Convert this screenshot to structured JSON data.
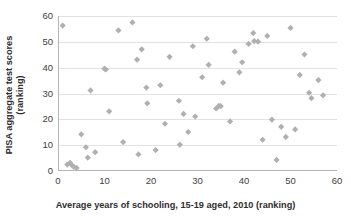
{
  "chart_data": {
    "type": "scatter",
    "title": "",
    "xlabel": "Average years of schooling, 15-19 aged, 2010 (ranking)",
    "ylabel_lines": [
      "PISA aggregate test scores",
      "(ranking)"
    ],
    "ylabel": "PISA aggregate test scores (ranking)",
    "xlim": [
      0,
      60
    ],
    "ylim": [
      0,
      60
    ],
    "xticks": [
      0,
      10,
      20,
      30,
      40,
      50,
      60
    ],
    "yticks": [
      0,
      10,
      20,
      30,
      40,
      50,
      60
    ],
    "grid": "horizontal",
    "legend": "none",
    "marker": "diamond",
    "marker_color": "#b0b0b0",
    "series": [
      {
        "name": "Countries",
        "points": [
          [
            1,
            56.3
          ],
          [
            2,
            2.5
          ],
          [
            2.6,
            3.2
          ],
          [
            3,
            2.2
          ],
          [
            3.4,
            1.6
          ],
          [
            4,
            1.2
          ],
          [
            5,
            14.2
          ],
          [
            6,
            9.2
          ],
          [
            6.4,
            5.2
          ],
          [
            7,
            31.2
          ],
          [
            8,
            7.3
          ],
          [
            10,
            39.6
          ],
          [
            10.3,
            39.3
          ],
          [
            11,
            23.1
          ],
          [
            13,
            54.4
          ],
          [
            14,
            11.2
          ],
          [
            16,
            57.5
          ],
          [
            17,
            43.1
          ],
          [
            17.3,
            6.4
          ],
          [
            18,
            47.1
          ],
          [
            19,
            32.3
          ],
          [
            19.2,
            26.2
          ],
          [
            21,
            8.1
          ],
          [
            22,
            33.2
          ],
          [
            23,
            18.3
          ],
          [
            24,
            44.2
          ],
          [
            26,
            27.2
          ],
          [
            26.2,
            10.2
          ],
          [
            27,
            22.1
          ],
          [
            28,
            15.1
          ],
          [
            29,
            48.3
          ],
          [
            29.5,
            21.1
          ],
          [
            31,
            36.3
          ],
          [
            32,
            51.2
          ],
          [
            32.4,
            41.1
          ],
          [
            34,
            24.2
          ],
          [
            34.6,
            25.2
          ],
          [
            35,
            25.1
          ],
          [
            35.5,
            34.2
          ],
          [
            37,
            19.2
          ],
          [
            38,
            46.2
          ],
          [
            39,
            38.2
          ],
          [
            39.6,
            42.1
          ],
          [
            41,
            49.2
          ],
          [
            42,
            53.4
          ],
          [
            42.2,
            50.3
          ],
          [
            43,
            50.1
          ],
          [
            44,
            12.1
          ],
          [
            45,
            52.3
          ],
          [
            46,
            19.9
          ],
          [
            47,
            4.3
          ],
          [
            48,
            17.1
          ],
          [
            49,
            13.2
          ],
          [
            50,
            55.4
          ],
          [
            51,
            16.1
          ],
          [
            52,
            37.2
          ],
          [
            53,
            45.1
          ],
          [
            54,
            30.3
          ],
          [
            54.5,
            28.2
          ],
          [
            56,
            35.2
          ],
          [
            57,
            29.3
          ]
        ]
      }
    ]
  }
}
